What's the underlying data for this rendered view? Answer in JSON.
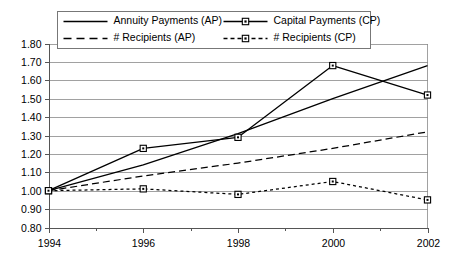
{
  "chart_data": {
    "type": "line",
    "title": "",
    "subtitle": "",
    "xlabel": "",
    "ylabel": "",
    "x": [
      1994,
      1996,
      1998,
      2000,
      2002
    ],
    "categories": [
      "1994",
      "1996",
      "1998",
      "2000",
      "2002"
    ],
    "xlim": [
      1994,
      2002
    ],
    "ylim": [
      0.8,
      1.8
    ],
    "y_ticks": [
      "0.80",
      "0.90",
      "1.00",
      "1.10",
      "1.20",
      "1.30",
      "1.40",
      "1.50",
      "1.60",
      "1.70",
      "1.80"
    ],
    "y_tick_values": [
      0.8,
      0.9,
      1.0,
      1.1,
      1.2,
      1.3,
      1.4,
      1.5,
      1.6,
      1.7,
      1.8
    ],
    "x_ticks": [
      "1994",
      "1996",
      "1998",
      "2000",
      "2002"
    ],
    "x_minor_ticks": [
      1995,
      1997,
      1999,
      2001
    ],
    "grid": "horizontal",
    "legend_position": "top-inside",
    "series": [
      {
        "name": "Annuity Payments (AP)",
        "style": "solid",
        "marker": "none",
        "color": "#000000",
        "values": [
          1.0,
          1.14,
          1.31,
          1.5,
          1.68
        ]
      },
      {
        "name": "Capital Payments (CP)",
        "style": "solid",
        "marker": "square",
        "color": "#000000",
        "values": [
          1.0,
          1.23,
          1.29,
          1.68,
          1.52
        ]
      },
      {
        "name": "# Recipients (AP)",
        "style": "dashed",
        "marker": "none",
        "color": "#000000",
        "values": [
          1.0,
          1.08,
          1.15,
          1.23,
          1.32
        ]
      },
      {
        "name": "# Recipients (CP)",
        "style": "dotted",
        "marker": "square",
        "color": "#000000",
        "values": [
          1.0,
          1.01,
          0.98,
          1.05,
          0.95
        ]
      }
    ]
  },
  "legend": {
    "entries": [
      {
        "label": "Annuity Payments (AP)"
      },
      {
        "label": "Capital Payments (CP)"
      },
      {
        "label": "# Recipients (AP)"
      },
      {
        "label": "# Recipients (CP)"
      }
    ]
  },
  "axes": {
    "y_labels": [
      "1.80",
      "1.70",
      "1.60",
      "1.50",
      "1.40",
      "1.30",
      "1.20",
      "1.10",
      "1.00",
      "0.90",
      "0.80"
    ],
    "x_labels": [
      "1994",
      "1996",
      "1998",
      "2000",
      "2002"
    ]
  }
}
